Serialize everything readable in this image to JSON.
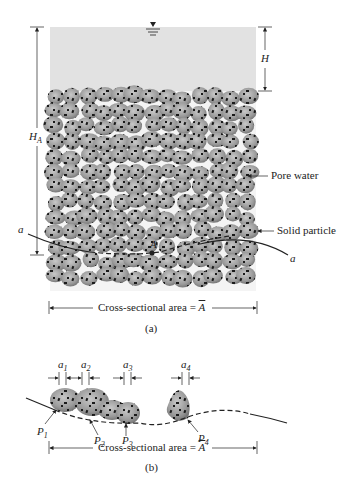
{
  "figure_a": {
    "label_H": "H",
    "label_HA": "H",
    "label_HA_sub": "A",
    "label_pore_water": "Pore water",
    "label_solid_particle": "Solid particle",
    "label_a_left": "a",
    "label_a_right": "a",
    "label_A_point": "A",
    "cross_section": "Cross-sectional area = ",
    "cross_section_symbol": "A",
    "caption": "(a)"
  },
  "figure_b": {
    "a_labels": [
      {
        "t": "a",
        "s": "1"
      },
      {
        "t": "a",
        "s": "2"
      },
      {
        "t": "a",
        "s": "3"
      },
      {
        "t": "a",
        "s": "4"
      }
    ],
    "p_labels": [
      {
        "t": "P",
        "s": "1"
      },
      {
        "t": "P",
        "s": "2"
      },
      {
        "t": "P",
        "s": "3"
      },
      {
        "t": "P",
        "s": "4"
      }
    ],
    "cross_section": "Cross-sectional area = ",
    "cross_section_symbol": "A",
    "caption": "(b)"
  },
  "colors": {
    "water": "#e2e2e2",
    "particle": "#9a9a9a",
    "particle_dark": "#777777",
    "speck": "#1a1a1a"
  }
}
